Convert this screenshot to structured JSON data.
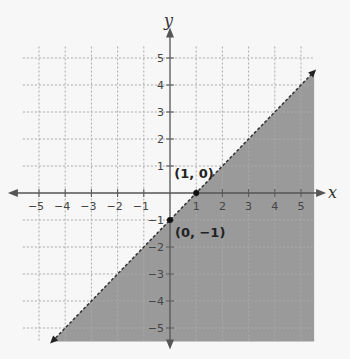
{
  "chart_data": {
    "type": "line",
    "title": "",
    "xlabel": "x",
    "ylabel": "y",
    "xlim": [
      -5.5,
      5.5
    ],
    "ylim": [
      -5.5,
      5.5
    ],
    "grid": true,
    "x_ticks": [
      "−5",
      "−4",
      "−3",
      "−2",
      "−1",
      "1",
      "2",
      "3",
      "4",
      "5"
    ],
    "y_ticks": [
      "5",
      "4",
      "3",
      "2",
      "1",
      "−1",
      "−2",
      "−3",
      "−4",
      "−5"
    ],
    "series": [
      {
        "name": "boundary y = x − 1",
        "style": "dashed",
        "points": [
          [
            -4.5,
            -5.5
          ],
          [
            5.5,
            4.5
          ]
        ],
        "equation": "y = x - 1"
      }
    ],
    "shaded_region": "below/right of line (y < x − 1)",
    "annotations": [
      {
        "label": "(1, 0)",
        "x": 1,
        "y": 0
      },
      {
        "label": "(0, −1)",
        "x": 0,
        "y": -1
      }
    ],
    "colors": {
      "shade": "#9a9a9a",
      "grid": "#aaaaaa",
      "axis": "#555555",
      "background": "#f7f7f7"
    }
  },
  "labels": {
    "x_axis": "x",
    "y_axis": "y",
    "point_a": "(1, 0)",
    "point_b": "(0, −1)"
  }
}
